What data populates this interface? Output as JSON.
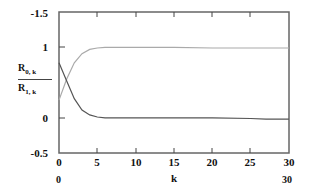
{
  "chart_data": {
    "type": "line",
    "title": "",
    "xlabel": "k",
    "ylabel": "R_{0,k} / R_{1,k}",
    "xlim": [
      0,
      30
    ],
    "ylim": [
      -0.5,
      1.5
    ],
    "x_ticks": [
      "0",
      "5",
      "10",
      "15",
      "20",
      "25",
      "30"
    ],
    "y_ticks": [
      "-1.5",
      "1",
      "0",
      "-0.5"
    ],
    "x_range_labels": {
      "min": "0",
      "max": "30"
    },
    "grid": false,
    "legend": {
      "position": "left",
      "entries": [
        "R0,k",
        "R1,k"
      ]
    },
    "x": [
      0,
      1,
      2,
      3,
      4,
      5,
      6,
      8,
      10,
      15,
      20,
      25,
      27,
      30
    ],
    "series": [
      {
        "name": "R0,k",
        "color": "#555555",
        "values": [
          0.78,
          0.52,
          0.27,
          0.11,
          0.04,
          0.01,
          0.0,
          0.0,
          0.0,
          0.0,
          0.0,
          -0.01,
          -0.02,
          -0.02
        ]
      },
      {
        "name": "R1,k",
        "color": "#aaaaaa",
        "values": [
          0.25,
          0.55,
          0.78,
          0.91,
          0.97,
          0.99,
          1.0,
          1.0,
          1.0,
          1.0,
          0.99,
          0.99,
          0.99,
          0.99
        ]
      }
    ]
  },
  "labels": {
    "y_top": "-1.5",
    "y_one": "1",
    "y_zero": "0",
    "y_bottom": "-0.5",
    "x0": "0",
    "x5": "5",
    "x10": "10",
    "x15": "15",
    "x20": "20",
    "x25": "25",
    "x30": "30",
    "xaxis": "k",
    "xmin": "0",
    "xmax": "30",
    "legend_r0_main": "R",
    "legend_r0_sub": "0, k",
    "legend_r1_main": "R",
    "legend_r1_sub": "1, k"
  }
}
